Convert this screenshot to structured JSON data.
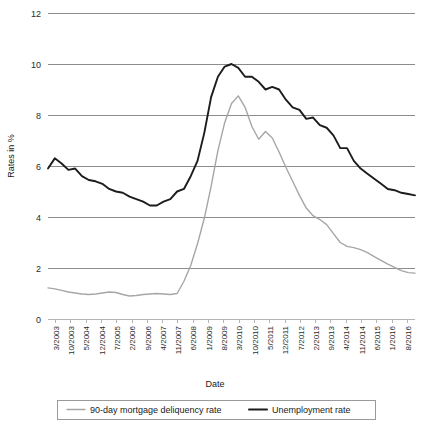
{
  "chart_data": {
    "type": "line",
    "title": "",
    "xlabel": "Date",
    "ylabel": "Rates in %",
    "ylim": [
      0,
      12
    ],
    "yticks": [
      0,
      2,
      4,
      6,
      8,
      10,
      12
    ],
    "grid": true,
    "legend_position": "bottom",
    "xtick_labels": [
      "3/2003",
      "10/2003",
      "5/2004",
      "12/2004",
      "7/2005",
      "2/2006",
      "9/2006",
      "4/2007",
      "11/2007",
      "6/2008",
      "1/2009",
      "8/2009",
      "3/2010",
      "10/2010",
      "5/2011",
      "12/2011",
      "7/2012",
      "2/2013",
      "9/2013",
      "4/2014",
      "11/2014",
      "6/2015",
      "1/2016",
      "8/2016"
    ],
    "x": [
      "3/2003",
      "6/2003",
      "9/2003",
      "12/2003",
      "3/2004",
      "6/2004",
      "9/2004",
      "12/2004",
      "3/2005",
      "6/2005",
      "9/2005",
      "12/2005",
      "3/2006",
      "6/2006",
      "9/2006",
      "12/2006",
      "3/2007",
      "6/2007",
      "9/2007",
      "12/2007",
      "3/2008",
      "6/2008",
      "9/2008",
      "12/2008",
      "3/2009",
      "6/2009",
      "9/2009",
      "12/2009",
      "3/2010",
      "6/2010",
      "9/2010",
      "12/2010",
      "3/2011",
      "6/2011",
      "9/2011",
      "12/2011",
      "3/2012",
      "6/2012",
      "9/2012",
      "12/2012",
      "3/2013",
      "6/2013",
      "9/2013",
      "12/2013",
      "3/2014",
      "6/2014",
      "9/2014",
      "12/2014",
      "3/2015",
      "6/2015",
      "9/2015",
      "12/2015",
      "3/2016",
      "6/2016",
      "8/2016"
    ],
    "series": [
      {
        "name": "90-day mortgage deliquency rate",
        "color": "#a6a6a6",
        "values": [
          1.22,
          1.18,
          1.12,
          1.06,
          1.02,
          0.98,
          0.96,
          0.98,
          1.02,
          1.06,
          1.04,
          0.96,
          0.9,
          0.92,
          0.96,
          0.98,
          1.0,
          0.98,
          0.96,
          1.0,
          1.48,
          2.1,
          2.95,
          3.95,
          5.2,
          6.6,
          7.7,
          8.45,
          8.75,
          8.3,
          7.55,
          7.05,
          7.35,
          7.1,
          6.55,
          5.95,
          5.4,
          4.85,
          4.35,
          4.05,
          3.9,
          3.7,
          3.35,
          3.0,
          2.85,
          2.8,
          2.72,
          2.6,
          2.45,
          2.3,
          2.15,
          2.02,
          1.9,
          1.82,
          1.8
        ]
      },
      {
        "name": "Unemployment rate",
        "color": "#1c1c1c",
        "values": [
          5.9,
          6.3,
          6.1,
          5.85,
          5.9,
          5.6,
          5.45,
          5.4,
          5.3,
          5.1,
          5.0,
          4.95,
          4.8,
          4.7,
          4.6,
          4.45,
          4.45,
          4.6,
          4.7,
          5.0,
          5.1,
          5.6,
          6.2,
          7.3,
          8.7,
          9.5,
          9.9,
          10.0,
          9.85,
          9.5,
          9.5,
          9.3,
          9.0,
          9.1,
          9.0,
          8.6,
          8.3,
          8.2,
          7.85,
          7.9,
          7.6,
          7.5,
          7.2,
          6.7,
          6.7,
          6.2,
          5.9,
          5.7,
          5.5,
          5.3,
          5.1,
          5.05,
          4.95,
          4.9,
          4.85
        ]
      }
    ],
    "legend_entries": [
      {
        "label": "90-day mortgage deliquency rate",
        "color": "#a6a6a6"
      },
      {
        "label": "Unemployment rate",
        "color": "#1c1c1c"
      }
    ]
  }
}
